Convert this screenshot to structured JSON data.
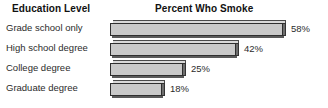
{
  "header": {
    "left_title": "Education Level",
    "right_title": "Percent Who Smoke"
  },
  "chart_data": {
    "type": "bar",
    "orientation": "horizontal",
    "title": "Percent Who Smoke",
    "xlabel": "Percent Who Smoke",
    "ylabel": "Education Level",
    "categories": [
      "Grade school only",
      "High school degree",
      "College degree",
      "Graduate degree"
    ],
    "values": [
      58,
      42,
      25,
      18
    ],
    "value_labels": [
      "58%",
      "42%",
      "25%",
      "18%"
    ],
    "unit": "%",
    "xlim": [
      0,
      58
    ],
    "grid": false,
    "legend": false,
    "style": {
      "bar_fill": "#c9c9c9",
      "bar_top_face": "#d9d9d9",
      "bar_side_face": "#6e6e6e",
      "bar_outline": "#2f2f2f",
      "background": "#ffffff",
      "text": "#2b2b2b",
      "title_text": "#111111"
    },
    "bars": [
      {
        "category": "Grade school only",
        "value": 58,
        "label": "58%",
        "bar_px_width": 173
      },
      {
        "category": "High school degree",
        "value": 42,
        "label": "42%",
        "bar_px_width": 126
      },
      {
        "category": "College degree",
        "value": 25,
        "label": "25%",
        "bar_px_width": 73
      },
      {
        "category": "Graduate degree",
        "value": 18,
        "label": "18%",
        "bar_px_width": 52
      }
    ]
  }
}
